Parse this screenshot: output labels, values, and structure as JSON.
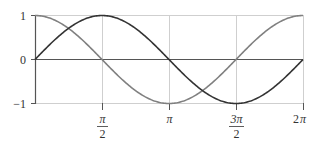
{
  "chart_data": {
    "type": "line",
    "title": "",
    "xlabel": "",
    "ylabel": "",
    "xlim": [
      0,
      6.2832
    ],
    "ylim": [
      -1,
      1
    ],
    "grid": true,
    "legend": null,
    "x_ticks": [
      {
        "value": 1.5708,
        "label_num": "π",
        "label_den": "2",
        "kind": "fraction"
      },
      {
        "value": 3.1416,
        "label": "π",
        "kind": "plain"
      },
      {
        "value": 4.7124,
        "label_num": "3π",
        "label_den": "2",
        "kind": "fraction"
      },
      {
        "value": 6.2832,
        "label": "2π",
        "kind": "plain"
      }
    ],
    "y_ticks": [
      {
        "value": 1,
        "label": "1"
      },
      {
        "value": 0,
        "label": "0"
      },
      {
        "value": -1,
        "label": "−1"
      }
    ],
    "x": [
      0,
      0.7854,
      1.5708,
      2.3562,
      3.1416,
      3.927,
      4.7124,
      5.4978,
      6.2832
    ],
    "series": [
      {
        "name": "sin x",
        "color": "#333333",
        "values": [
          0,
          0.707,
          1,
          0.707,
          0,
          -0.707,
          -1,
          -0.707,
          0
        ]
      },
      {
        "name": "cos x",
        "color": "#808080",
        "values": [
          1,
          0.707,
          0,
          -0.707,
          -1,
          -0.707,
          0,
          0.707,
          1
        ]
      }
    ]
  },
  "colors": {
    "axis": "#444444",
    "grid": "#cccccc",
    "zero_line": "#555555"
  },
  "labels": {
    "y_1": "1",
    "y_0": "0",
    "y_m1": "−1",
    "x_pi_2_num": "π",
    "x_pi_2_den": "2",
    "x_pi": "π",
    "x_3pi_2_num": "3π",
    "x_3pi_2_den": "2",
    "x_2pi_num": "2",
    "x_2pi_pi": "π"
  }
}
